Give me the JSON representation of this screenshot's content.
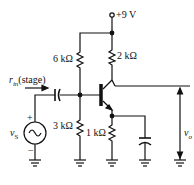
{
  "diagram": {
    "type": "circuit-schematic",
    "supply": {
      "label": "+9 V"
    },
    "resistors": [
      {
        "id": "R1",
        "label": "6 kΩ"
      },
      {
        "id": "RC",
        "label": "2 kΩ"
      },
      {
        "id": "R2",
        "label": "3 kΩ"
      },
      {
        "id": "RE",
        "label": "1 kΩ"
      }
    ],
    "input_label": {
      "main": "r",
      "sub": "in",
      "suffix": "(stage)"
    },
    "source": {
      "main": "v",
      "sub": "S",
      "plus": "+",
      "minus": "−"
    },
    "output": {
      "main": "v",
      "sub": "o"
    },
    "colors": {
      "ink": "#111111",
      "background": "#ffffff"
    }
  }
}
